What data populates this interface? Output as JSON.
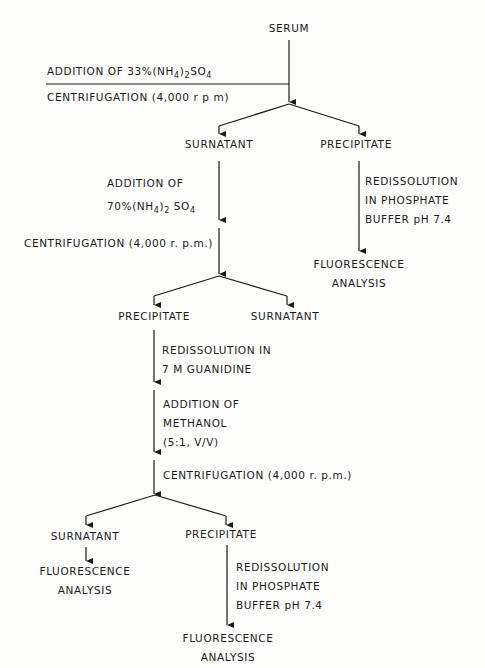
{
  "diagram": {
    "type": "flowchart",
    "nodes": {
      "serum": "SERUM",
      "surnatant_1": "SURNATANT",
      "precipitate_1": "PRECIPITATE",
      "fluorescence_1": [
        "FLUORESCENCE",
        "ANALYSIS"
      ],
      "precipitate_2": "PRECIPITATE",
      "surnatant_2": "SURNATANT",
      "surnatant_3": "SURNATANT",
      "fluorescence_2": [
        "FLUORESCENCE",
        "ANALYSIS"
      ],
      "precipitate_3": "PRECIPITATE",
      "fluorescence_3": [
        "FLUORESCENCE",
        "ANALYSIS"
      ]
    },
    "steps": {
      "step1_addition": {
        "prefix": "ADDITION  OF  33%(NH",
        "sub1": "4",
        "mid": ")",
        "sub2": "2",
        "suffix": "SO",
        "sub3": "4"
      },
      "step1_centrifugation": "CENTRIFUGATION (4,000  r p m)",
      "step2_redissolution": [
        "REDISSOLUTION",
        "IN  PHOSPHATE",
        "BUFFER  pH  7.4"
      ],
      "step3_addition": {
        "line1": "ADDITION   OF",
        "prefix": "70%(NH",
        "sub1": "4",
        "mid": ")",
        "sub2": "2",
        "suffix": " SO",
        "sub3": "4"
      },
      "step3_centrifugation": "CENTRIFUGATION  (4,000 r. p.m.)",
      "step4_redissolution": [
        "REDISSOLUTION  IN",
        "7 M  GUANIDINE"
      ],
      "step5_addition": [
        "ADDITION  OF",
        "METHANOL",
        "(5:1,  V/V)"
      ],
      "step5_centrifugation": "CENTRIFUGATION   (4,000 r. p.m.)",
      "step6_redissolution": [
        "REDISSOLUTION",
        "IN  PHOSPHATE",
        "BUFFER  pH  7.4"
      ]
    },
    "line_color": "#1a1a1a",
    "background_color": "#fdfdfc"
  }
}
